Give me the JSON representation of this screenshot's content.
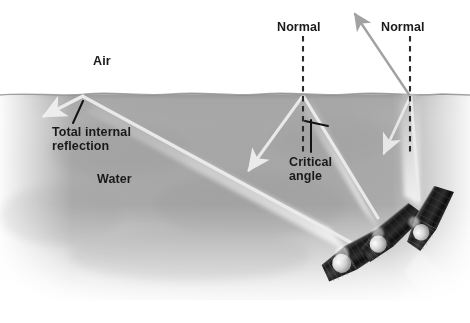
{
  "figure": {
    "media_left": "Air",
    "media_right": "Water"
  },
  "labels": {
    "air": "Air",
    "water": "Water",
    "normal_left": "Normal",
    "normal_right": "Normal",
    "total_internal_reflection": "Total internal\nreflection",
    "total_internal_reflection_line1": "Total internal",
    "total_internal_reflection_line2": "reflection",
    "critical_angle": "Critical\nangle",
    "critical_angle_line1": "Critical",
    "critical_angle_line2": "angle"
  },
  "colors": {
    "air": "#ffffff",
    "water": "#a9a9a9",
    "water_deep": "#9a9a9a",
    "ray": "#e8e8e8",
    "ray_gray": "#9b9b9b",
    "text": "#1a1a1a",
    "normal_line": "#2b2b2b",
    "leader_line": "#1a1a1a",
    "flashlight_body": "#1c1c1c",
    "flashlight_lens": "#d9d9d9",
    "beam": "#f2f2f2"
  },
  "surface": {
    "name": "water-air-boundary",
    "y": 94,
    "style": "wavy"
  },
  "normals": [
    {
      "name": "normal-left",
      "x": 303,
      "y_top": 36,
      "y_bottom": 150,
      "dashed": true
    },
    {
      "name": "normal-right",
      "x": 410,
      "y_top": 36,
      "y_bottom": 150,
      "dashed": true
    }
  ],
  "flashlights": [
    {
      "name": "flashlight-left",
      "cx": 364,
      "cy": 246,
      "angle_deg": -42,
      "case": "total-internal-reflection"
    },
    {
      "name": "flashlight-mid",
      "cx": 392,
      "cy": 223,
      "angle_deg": -52,
      "case": "critical-angle"
    },
    {
      "name": "flashlight-right",
      "cx": 425,
      "cy": 210,
      "angle_deg": -66,
      "case": "partial-refraction"
    }
  ],
  "rays": [
    {
      "name": "incident-ray-left",
      "from": [
        352,
        243
      ],
      "to": [
        82,
        96
      ],
      "kind": "incident"
    },
    {
      "name": "reflected-ray-tir",
      "from": [
        82,
        96
      ],
      "to": [
        42,
        117
      ],
      "kind": "reflected",
      "arrow": true
    },
    {
      "name": "incident-ray-mid",
      "from": [
        378,
        218
      ],
      "to": [
        303,
        96
      ],
      "kind": "incident"
    },
    {
      "name": "refracted-ray-grazing",
      "from": [
        303,
        96
      ],
      "to": [
        198,
        96
      ],
      "kind": "refracted",
      "arrow": true,
      "note": "refracts at 90 degrees along surface"
    },
    {
      "name": "reflected-ray-mid",
      "from": [
        303,
        96
      ],
      "to": [
        246,
        172
      ],
      "kind": "reflected",
      "arrow": true
    },
    {
      "name": "incident-ray-right",
      "from": [
        418,
        198
      ],
      "to": [
        410,
        96
      ],
      "kind": "incident"
    },
    {
      "name": "refracted-ray-right",
      "from": [
        410,
        96
      ],
      "to": [
        352,
        10
      ],
      "kind": "refracted",
      "arrow": true
    },
    {
      "name": "reflected-ray-right",
      "from": [
        410,
        96
      ],
      "to": [
        381,
        157
      ],
      "kind": "reflected",
      "arrow": true
    }
  ],
  "annotations": {
    "tir_leader": {
      "name": "tir-leader-line",
      "from": [
        82,
        100
      ],
      "to": [
        73,
        122
      ]
    },
    "critical_marker": {
      "name": "critical-angle-marker",
      "corner": [
        311,
        151
      ],
      "up": [
        311,
        119
      ],
      "tick": [
        327,
        124
      ]
    }
  }
}
